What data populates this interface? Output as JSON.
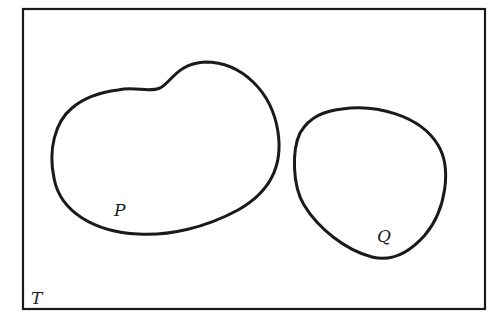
{
  "diagram": {
    "type": "venn-diagram",
    "universe": {
      "label": "T"
    },
    "sets": [
      {
        "id": "P",
        "label": "P"
      },
      {
        "id": "Q",
        "label": "Q"
      }
    ],
    "relationship": "disjoint",
    "colors": {
      "stroke": "#1a1a1a",
      "background": "#ffffff"
    }
  }
}
